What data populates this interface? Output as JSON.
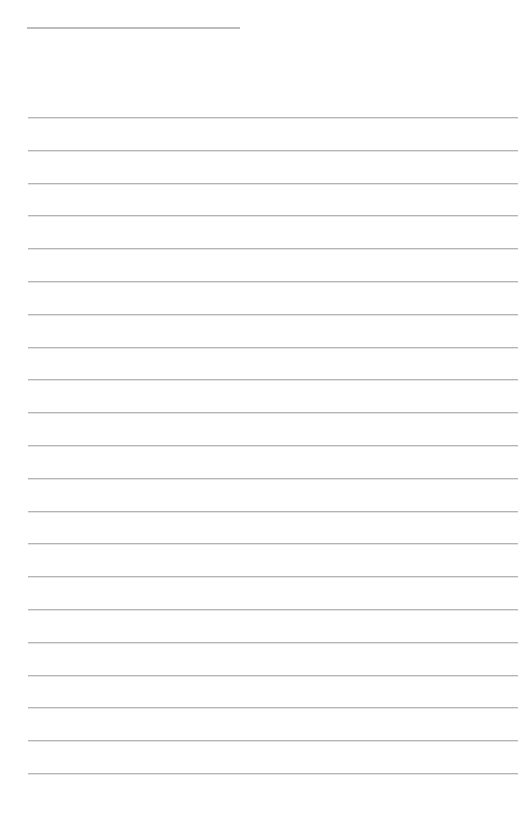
{
  "page": {
    "type": "lined-paper",
    "background": "#ffffff",
    "line_color": "#b5b5b5",
    "header_line": {
      "left": 27,
      "top": 27,
      "width": 213
    },
    "ruled_lines": {
      "count": 21,
      "left": 28,
      "width": 490,
      "first_top": 117,
      "spacing": 32.8
    }
  }
}
